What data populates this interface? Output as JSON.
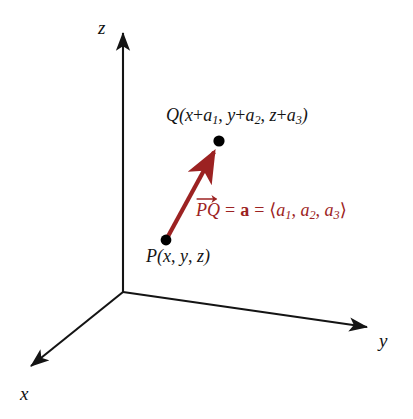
{
  "figure": {
    "background_color": "#ffffff",
    "axis_color": "#141414",
    "vector_color": "#9c2222",
    "point_color": "#000000"
  },
  "axes": [
    {
      "name": "z",
      "label": "z",
      "direction": "up"
    },
    {
      "name": "y",
      "label": "y",
      "direction": "right"
    },
    {
      "name": "x",
      "label": "x",
      "direction": "down-left"
    }
  ],
  "points": [
    {
      "name": "P",
      "label_prefix": "P",
      "label_full": "P(x, y, z)",
      "coords": "(x, y, z)",
      "pixel": [
        166,
        240
      ]
    },
    {
      "name": "Q",
      "label_prefix": "Q",
      "label_full": "Q(x + a1, y + a2, z + a3)",
      "coords": "(x + a1, y + a2, z + a3)",
      "pixel": [
        219,
        141
      ]
    }
  ],
  "vector": {
    "from": "P",
    "to": "Q",
    "name_plain": "PQ",
    "name_p": "P",
    "name_q": "Q",
    "equals_1": "=",
    "bold_name": "a",
    "equals_2": "=",
    "component_open": "⟨",
    "component_close": "⟩",
    "component_base": "a",
    "component_subs": [
      "1",
      "2",
      "3"
    ],
    "comma": ",",
    "full_text": "PQ = a = ⟨a1, a2, a3⟩",
    "color": "#9c2222"
  },
  "q_label_parts": {
    "open": "Q(",
    "x_var": "x",
    "plus": "+",
    "a_base": "a",
    "sub1": "1",
    "comma1": ", ",
    "y_var": "y",
    "sub2": "2",
    "comma2": ", ",
    "z_var": "z",
    "sub3": "3",
    "close": ")"
  },
  "p_label_parts": {
    "open": "P(",
    "x_var": "x",
    "comma1": ", ",
    "y_var": "y",
    "comma2": ", ",
    "z_var": "z",
    "close": ")"
  }
}
